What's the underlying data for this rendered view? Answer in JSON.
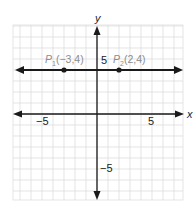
{
  "chart_data": {
    "type": "line",
    "title": "",
    "xlabel": "x",
    "ylabel": "y",
    "xlim": [
      -7.5,
      7.8
    ],
    "ylim": [
      -7.8,
      8.0
    ],
    "grid": true,
    "grid_step": 1,
    "x_ticks_labeled": [
      {
        "value": -5,
        "label": "−5"
      },
      {
        "value": 5,
        "label": "5"
      }
    ],
    "y_ticks_labeled": [
      {
        "value": 5,
        "label": "5"
      },
      {
        "value": -5,
        "label": "−5"
      }
    ],
    "series": [
      {
        "name": "horizontal line y = 4",
        "kind": "line-with-arrows",
        "points": [
          [
            -7.3,
            4
          ],
          [
            7.7,
            4
          ]
        ]
      }
    ],
    "points": [
      {
        "name": "P1",
        "x": -3,
        "y": 4,
        "label_main": "P",
        "label_sub": "1",
        "label_coords": "(−3,4)"
      },
      {
        "name": "P2",
        "x": 2,
        "y": 4,
        "label_main": "P",
        "label_sub": "2",
        "label_coords": "(2,4)"
      }
    ],
    "colors": {
      "axis": "#1a1a1a",
      "grid": "#d9d9d9",
      "point_label": "#8c8c8c",
      "tick_label": "#222222"
    }
  }
}
